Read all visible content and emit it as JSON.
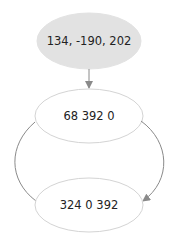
{
  "diagram": {
    "nodes": [
      {
        "id": "n1",
        "label": "134, -190, 202",
        "fill": "#e2e2e2",
        "stroke": "#e2e2e2"
      },
      {
        "id": "n2",
        "label": "68 392 0",
        "fill": "#ffffff",
        "stroke": "#d4d4d4"
      },
      {
        "id": "n3",
        "label": "324 0 392",
        "fill": "#ffffff",
        "stroke": "#d4d4d4"
      }
    ],
    "edges": [
      {
        "from": "n1",
        "to": "n2",
        "arrow": true
      },
      {
        "from": "n2",
        "to": "n3",
        "side": "left",
        "arrow": false
      },
      {
        "from": "n2",
        "to": "n3",
        "side": "right",
        "arrow": true
      }
    ],
    "colors": {
      "edge": "#8a8a8a",
      "text": "#222222"
    }
  }
}
